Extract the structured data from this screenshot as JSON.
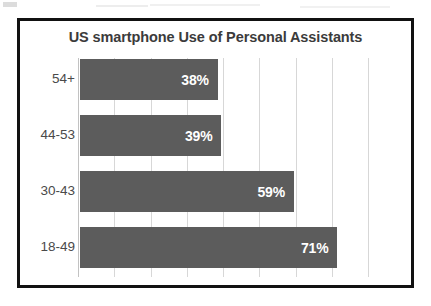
{
  "chart_data": {
    "type": "bar",
    "orientation": "horizontal",
    "title": "US smartphone Use of Personal Assistants",
    "categories": [
      "54+",
      "44-53",
      "30-43",
      "18-49"
    ],
    "values": [
      38,
      39,
      59,
      71
    ],
    "value_labels": [
      "38%",
      "39%",
      "59%",
      "71%"
    ],
    "xlabel": "",
    "ylabel": "",
    "xlim": [
      0,
      80
    ],
    "gridline_values": [
      0,
      10,
      20,
      30,
      40,
      50,
      60,
      70,
      80
    ],
    "grid": true,
    "legend": "none",
    "bar_color": "#5c5c5c",
    "value_label_color": "#ffffff",
    "title_color": "#3b3b3b",
    "category_label_color": "#4a4a4a",
    "gridline_color": "#d7d7d7",
    "frame_color": "#111111",
    "background_color": "#ffffff"
  }
}
